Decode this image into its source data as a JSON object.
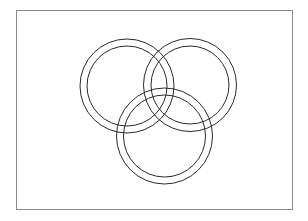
{
  "diagram": {
    "type": "interlocking-rings",
    "background": "#ffffff",
    "frame": {
      "x": 16.5,
      "y": 10.5,
      "width": 276,
      "height": 199,
      "stroke": "#8a8a8a",
      "stroke_width": 1
    },
    "ring_stroke": "#2a2a2a",
    "ring_stroke_width": 1,
    "rings": [
      {
        "name": "ring-top-left",
        "cx": 127,
        "cy": 86,
        "outer_r": 47,
        "inner_r": 40
      },
      {
        "name": "ring-top-right",
        "cx": 190,
        "cy": 85,
        "outer_r": 46.5,
        "inner_r": 39
      },
      {
        "name": "ring-bottom",
        "cx": 164.5,
        "cy": 136,
        "outer_r": 48,
        "inner_r": 41
      }
    ]
  }
}
